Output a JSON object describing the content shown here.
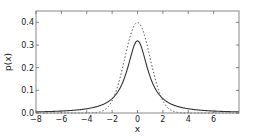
{
  "chart_data": {
    "type": "line",
    "title": "",
    "xlabel": "x",
    "ylabel": "p(x)",
    "xlim": [
      -8,
      8
    ],
    "ylim": [
      0,
      0.45
    ],
    "grid": false,
    "legend": null,
    "xticks": [
      -8,
      -6,
      -4,
      -2,
      0,
      2,
      4,
      6
    ],
    "xtick_labels": [
      "−8",
      "−6",
      "−4",
      "−2",
      "0",
      "2",
      "4",
      "6"
    ],
    "yticks": [
      0.0,
      0.1,
      0.2,
      0.3,
      0.4
    ],
    "ytick_labels": [
      "0.0",
      "0.1",
      "0.2",
      "0.3",
      "0.4"
    ],
    "series": [
      {
        "name": "Cauchy density",
        "style": "solid",
        "color": "#333333",
        "x": [
          -8,
          -6,
          -4,
          -3,
          -2,
          -1.5,
          -1,
          -0.5,
          0,
          0.5,
          1,
          1.5,
          2,
          3,
          4,
          6,
          8
        ],
        "values": [
          0.0049,
          0.0086,
          0.0187,
          0.0318,
          0.0637,
          0.0979,
          0.1592,
          0.2546,
          0.3183,
          0.2546,
          0.1592,
          0.0979,
          0.0637,
          0.0318,
          0.0187,
          0.0086,
          0.0049
        ]
      },
      {
        "name": "Normal density",
        "style": "dotted",
        "color": "#555555",
        "x": [
          -8,
          -4,
          -3,
          -2.5,
          -2,
          -1.5,
          -1,
          -0.5,
          0,
          0.5,
          1,
          1.5,
          2,
          2.5,
          3,
          4,
          8
        ],
        "values": [
          0.0,
          0.0001,
          0.0044,
          0.0175,
          0.054,
          0.1295,
          0.242,
          0.3521,
          0.3989,
          0.3521,
          0.242,
          0.1295,
          0.054,
          0.0175,
          0.0044,
          0.0001,
          0.0
        ]
      }
    ]
  }
}
